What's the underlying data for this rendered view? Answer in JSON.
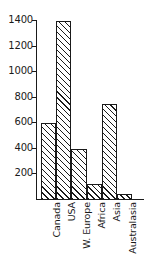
{
  "chart_data": {
    "type": "bar",
    "title": "",
    "subtitle": "",
    "xlabel": "",
    "ylabel": "",
    "categories": [
      "Canada",
      "USA",
      "W. Europe",
      "Africa",
      "Asia",
      "Australasia"
    ],
    "values": [
      600,
      1400,
      400,
      125,
      750,
      50
    ],
    "ylim": [
      0,
      1400
    ],
    "y_ticks": [
      200,
      400,
      600,
      800,
      1000,
      1200,
      1400
    ],
    "y_tick_labels": [
      "200",
      "400",
      "600",
      "800",
      "1000",
      "1200",
      "1400"
    ],
    "grid": false,
    "legend": null,
    "legend_position": "none",
    "annotations": [],
    "bar_style": {
      "fill": "#ffffff",
      "hatch": "/",
      "edge_color": "#1a1a1a",
      "gap": 0
    },
    "axis_color": "#1a1a1a",
    "background": "#ffffff"
  }
}
